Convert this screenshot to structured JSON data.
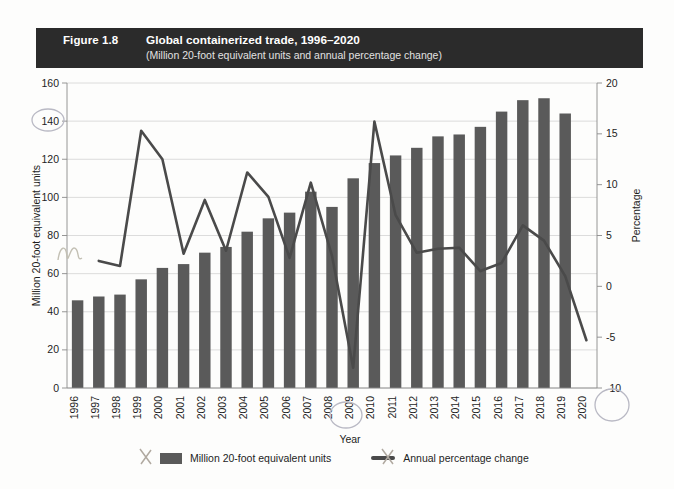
{
  "figure": {
    "number_label": "Figure 1.8",
    "title": "Global containerized trade, 1996–2020",
    "subtitle": "(Million 20-foot equivalent units and annual percentage change)",
    "title_bar_color": "#2b2b2b",
    "bar_color": "#5a5a5a",
    "line_color": "#4a4a4a",
    "gridline_color": "#d3d3d3"
  },
  "legend": {
    "position": "bottom",
    "entries": [
      {
        "marker": "bar-swatch",
        "label": "Million 20-foot equivalent units"
      },
      {
        "marker": "line-swatch",
        "label": "Annual percentage change"
      }
    ]
  },
  "chart_data": {
    "type": "bar",
    "title": "Global containerized trade, 1996–2020",
    "subtitle": "(Million 20-foot equivalent units and annual percentage change)",
    "xlabel": "Year",
    "ylabel": "Million 20-foot equivalent units",
    "y2label": "Percentage",
    "ylim": [
      0,
      160
    ],
    "y2lim": [
      -10,
      20
    ],
    "yticks": [
      0,
      20,
      40,
      60,
      80,
      100,
      120,
      140,
      160
    ],
    "y2ticks": [
      -10,
      -5,
      0,
      5,
      10,
      15,
      20
    ],
    "ytick_labels": [
      "0",
      "20",
      "40",
      "60",
      "80",
      "100",
      "120",
      "140",
      "160"
    ],
    "y2tick_labels": [
      "-10",
      "-5",
      "0",
      "5",
      "10",
      "15",
      "20"
    ],
    "grid": true,
    "categories": [
      "1996",
      "1997",
      "1998",
      "1999",
      "2000",
      "2001",
      "2002",
      "2003",
      "2004",
      "2005",
      "2006",
      "2007",
      "2008",
      "2009",
      "2010",
      "2011",
      "2012",
      "2013",
      "2014",
      "2015",
      "2016",
      "2017",
      "2018",
      "2019",
      "2020"
    ],
    "series": [
      {
        "name": "Million 20-foot equivalent units",
        "type": "bar",
        "axis": "left",
        "values": [
          46,
          48,
          49,
          57,
          63,
          65,
          71,
          74,
          82,
          89,
          92,
          103,
          95,
          110,
          118,
          122,
          126,
          132,
          133,
          137,
          145,
          151,
          152,
          144,
          null
        ]
      },
      {
        "name": "Annual percentage change",
        "type": "line",
        "axis": "right",
        "values": [
          null,
          2.5,
          2.0,
          15.3,
          12.5,
          3.2,
          8.5,
          3.5,
          11.2,
          8.8,
          2.8,
          10.2,
          3.0,
          -8.0,
          16.2,
          7.0,
          3.3,
          3.7,
          3.8,
          1.5,
          2.3,
          6.0,
          4.5,
          1.0,
          -5.3
        ]
      }
    ],
    "note": "Bar series has 24 plotted bars spanning 1996-2019 plus a 2020 bar; line series spans 1997-2020."
  }
}
